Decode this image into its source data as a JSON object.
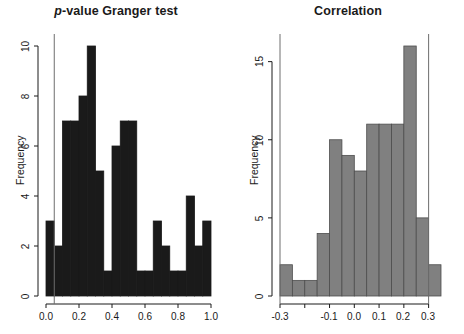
{
  "figure": {
    "width": 464,
    "height": 334,
    "background": "#ffffff"
  },
  "panels": [
    {
      "id": "granger",
      "title_prefix": "p",
      "title_rest": "-value Granger test",
      "title_plain": "p-value Granger test",
      "ylabel": "Frequency",
      "bar_color": "#1a1a1a",
      "bar_border": "#1a1a1a",
      "refline_color": "#6e6e6e",
      "yticks": [
        "0",
        "2",
        "4",
        "6",
        "8",
        "10"
      ],
      "xticks": [
        "0.0",
        "0.2",
        "0.4",
        "0.6",
        "0.8",
        "1.0"
      ]
    },
    {
      "id": "correlation",
      "title_prefix": "",
      "title_rest": "Correlation",
      "title_plain": "Correlation",
      "ylabel": "Frequency",
      "bar_color": "#808080",
      "bar_border": "#4d4d4d",
      "refline_color": "#6e6e6e",
      "yticks": [
        "0",
        "5",
        "10",
        "15"
      ],
      "xticks": [
        "-0.3",
        "-0.2",
        "-0.1",
        "0.0",
        "0.1",
        "0.2",
        "0.3"
      ]
    }
  ],
  "chart_data": [
    {
      "type": "bar",
      "subtype": "histogram",
      "id": "granger",
      "title": "p-value Granger test",
      "xlabel": "",
      "ylabel": "Frequency",
      "xlim": [
        0.0,
        1.0
      ],
      "ylim": [
        0,
        10
      ],
      "bin_width": 0.05,
      "grid": false,
      "legend": "none",
      "bar_color": "#1a1a1a",
      "bin_edges": [
        0.0,
        0.05,
        0.1,
        0.15,
        0.2,
        0.25,
        0.3,
        0.35,
        0.4,
        0.45,
        0.5,
        0.55,
        0.6,
        0.65,
        0.7,
        0.75,
        0.8,
        0.85,
        0.9,
        0.95,
        1.0
      ],
      "categories": [
        "0.00-0.05",
        "0.05-0.10",
        "0.10-0.15",
        "0.15-0.20",
        "0.20-0.25",
        "0.25-0.30",
        "0.30-0.35",
        "0.35-0.40",
        "0.40-0.45",
        "0.45-0.50",
        "0.50-0.55",
        "0.55-0.60",
        "0.60-0.65",
        "0.65-0.70",
        "0.70-0.75",
        "0.75-0.80",
        "0.80-0.85",
        "0.85-0.90",
        "0.90-0.95",
        "0.95-1.00"
      ],
      "values": [
        3,
        2,
        7,
        7,
        8,
        10,
        5,
        1,
        6,
        7,
        7,
        1,
        1,
        3,
        2,
        1,
        1,
        4,
        2,
        3
      ],
      "xticks": [
        0.0,
        0.2,
        0.4,
        0.6,
        0.8,
        1.0
      ],
      "xticklabels": [
        "0.0",
        "0.2",
        "0.4",
        "0.6",
        "0.8",
        "1.0"
      ],
      "yticks": [
        0,
        2,
        4,
        6,
        8,
        10
      ],
      "yticklabels": [
        "0",
        "2",
        "4",
        "6",
        "8",
        "10"
      ],
      "annotations": [
        {
          "type": "vline",
          "x": 0.05,
          "color": "#6e6e6e",
          "label": "significance threshold"
        }
      ]
    },
    {
      "type": "bar",
      "subtype": "histogram",
      "id": "correlation",
      "title": "Correlation",
      "xlabel": "",
      "ylabel": "Frequency",
      "xlim": [
        -0.3,
        0.35
      ],
      "ylim": [
        0,
        16
      ],
      "bin_width": 0.05,
      "grid": false,
      "legend": "none",
      "bar_color": "#808080",
      "bin_edges": [
        -0.3,
        -0.25,
        -0.2,
        -0.15,
        -0.1,
        -0.05,
        0.0,
        0.05,
        0.1,
        0.15,
        0.2,
        0.25,
        0.3,
        0.35
      ],
      "categories": [
        "-0.30--0.25",
        "-0.25--0.20",
        "-0.20--0.15",
        "-0.15--0.10",
        "-0.10--0.05",
        "-0.05-0.00",
        "0.00-0.05",
        "0.05-0.10",
        "0.10-0.15",
        "0.15-0.20",
        "0.20-0.25",
        "0.25-0.30",
        "0.30-0.35"
      ],
      "values": [
        2,
        1,
        1,
        4,
        10,
        9,
        8,
        11,
        11,
        11,
        16,
        5,
        2,
        1
      ],
      "xticks": [
        -0.3,
        -0.2,
        -0.1,
        0.0,
        0.1,
        0.2,
        0.3
      ],
      "xticklabels": [
        "-0.3",
        "-0.2",
        "-0.1",
        "0.0",
        "0.1",
        "0.2",
        "0.3"
      ],
      "yticks": [
        0,
        5,
        10,
        15
      ],
      "yticklabels": [
        "0",
        "5",
        "10",
        "15"
      ],
      "annotations": [
        {
          "type": "vline",
          "x": -0.3,
          "color": "#6e6e6e",
          "label": "left bound"
        },
        {
          "type": "vline",
          "x": 0.3,
          "color": "#6e6e6e",
          "label": "right bound"
        }
      ]
    }
  ]
}
